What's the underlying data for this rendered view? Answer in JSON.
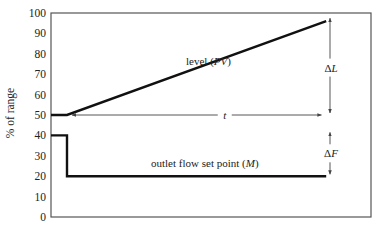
{
  "chart_data": {
    "type": "line",
    "title": "",
    "xlabel": "",
    "ylabel": "% of range",
    "ylim": [
      0,
      100
    ],
    "yticks": [
      0,
      10,
      20,
      30,
      40,
      50,
      60,
      70,
      80,
      90,
      100
    ],
    "grid": false,
    "legend": null,
    "x_normalized_range": [
      0,
      1
    ],
    "series": [
      {
        "name": "level (PV)",
        "label_text": "level (",
        "label_var": "PV",
        "label_close": ")",
        "points": [
          [
            0.0,
            50
          ],
          [
            0.05,
            50
          ],
          [
            0.86,
            96
          ]
        ]
      },
      {
        "name": "outlet flow set point (M)",
        "label_text": "outlet flow set point (",
        "label_var": "M",
        "label_close": ")",
        "points": [
          [
            0.0,
            40
          ],
          [
            0.05,
            40
          ],
          [
            0.05,
            20
          ],
          [
            0.86,
            20
          ]
        ]
      }
    ],
    "annotations": [
      {
        "type": "horizontal-arrow",
        "label": "t",
        "from_x": 0.066,
        "to_x": 0.845,
        "y": 50
      },
      {
        "type": "vertical-arrow",
        "label": "ΔL",
        "label_prefix": "Δ",
        "label_var": "L",
        "x": 0.875,
        "from_y": 50,
        "to_y": 96
      },
      {
        "type": "vertical-arrow",
        "label": "ΔF",
        "label_prefix": "Δ",
        "label_var": "F",
        "x": 0.875,
        "from_y": 20,
        "to_y": 40
      }
    ]
  },
  "colors": {
    "line": "#111111",
    "frame": "#555555",
    "arrow": "#444444",
    "text": "#222222"
  }
}
